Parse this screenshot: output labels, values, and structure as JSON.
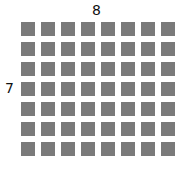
{
  "diagram": {
    "column_count_label": "8",
    "row_count_label": "7",
    "columns": 8,
    "rows": 7,
    "cell_color": "#7a7a7a"
  }
}
